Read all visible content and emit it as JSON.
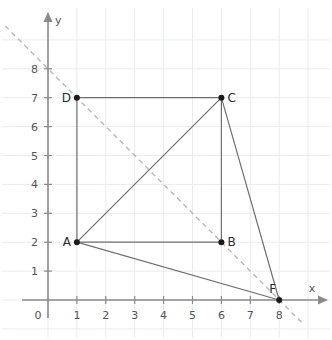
{
  "chart_data": {
    "type": "scatter",
    "title": "",
    "xlabel": "x",
    "ylabel": "y",
    "xlim": [
      0,
      8.8
    ],
    "ylim": [
      0,
      8.8
    ],
    "grid": true,
    "legend": "none",
    "x_ticks": [
      0,
      1,
      2,
      3,
      4,
      5,
      6,
      7,
      8
    ],
    "y_ticks": [
      0,
      1,
      2,
      3,
      4,
      5,
      6,
      7,
      8
    ],
    "x_tick_labels": [
      "0",
      "1",
      "2",
      "3",
      "4",
      "5",
      "6",
      "7",
      "8"
    ],
    "y_tick_labels": [
      "0",
      "1",
      "2",
      "3",
      "4",
      "5",
      "6",
      "7",
      "8"
    ],
    "origin_label": "0",
    "points": [
      {
        "name": "A",
        "x": 1,
        "y": 2,
        "label": "A",
        "label_side": "left"
      },
      {
        "name": "B",
        "x": 6,
        "y": 2,
        "label": "B",
        "label_side": "right"
      },
      {
        "name": "C",
        "x": 6,
        "y": 7,
        "label": "C",
        "label_side": "right"
      },
      {
        "name": "D",
        "x": 1,
        "y": 7,
        "label": "D",
        "label_side": "left"
      },
      {
        "name": "F",
        "x": 8,
        "y": 0,
        "label": "F",
        "label_side": "upper-left"
      }
    ],
    "segments": [
      {
        "name": "D-C",
        "from": "D",
        "to": "C",
        "style": "solid",
        "x1": 1,
        "y1": 7,
        "x2": 6,
        "y2": 7
      },
      {
        "name": "D-A",
        "from": "D",
        "to": "A",
        "style": "solid",
        "x1": 1,
        "y1": 7,
        "x2": 1,
        "y2": 2
      },
      {
        "name": "A-B",
        "from": "A",
        "to": "B",
        "style": "solid",
        "x1": 1,
        "y1": 2,
        "x2": 6,
        "y2": 2
      },
      {
        "name": "C-B",
        "from": "C",
        "to": "B",
        "style": "solid",
        "x1": 6,
        "y1": 7,
        "x2": 6,
        "y2": 2
      },
      {
        "name": "A-C",
        "from": "A",
        "to": "C",
        "style": "solid",
        "x1": 1,
        "y1": 2,
        "x2": 6,
        "y2": 7
      },
      {
        "name": "A-F",
        "from": "A",
        "to": "F",
        "style": "solid",
        "x1": 1,
        "y1": 2,
        "x2": 8,
        "y2": 0
      },
      {
        "name": "C-F",
        "from": "C",
        "to": "F",
        "style": "solid",
        "x1": 6,
        "y1": 7,
        "x2": 8,
        "y2": 0
      }
    ],
    "dashed_line": {
      "name": "dashed-diagonal",
      "slope": -1,
      "intercept": 8,
      "passes_through": [
        "B",
        "F"
      ],
      "x1": -1.48,
      "y1": 9.48,
      "x2": 8.86,
      "y2": -0.86
    },
    "colors": {
      "axis": "#8a8a8a",
      "grid": "#e8ecf0",
      "segment": "#6f6f6f",
      "dashed": "#b9b9b9",
      "point": "#1a1a1a",
      "label": "#2a2a2a",
      "tick_label": "#555555",
      "background": "#ffffff"
    }
  }
}
